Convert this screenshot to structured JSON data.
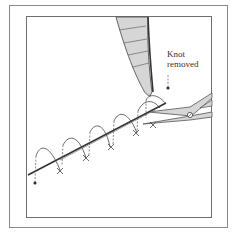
{
  "figure": {
    "annotation": {
      "line1": "Knot",
      "line2": "removed"
    },
    "colors": {
      "frame": "#7a7a7a",
      "instrument_fill": "#d6d6d6",
      "instrument_stroke": "#555555",
      "suture": "#333333",
      "incision": "#444444"
    },
    "elements": [
      "forceps",
      "scissors",
      "incision-line",
      "running-suture-loops",
      "knot-marker"
    ]
  }
}
